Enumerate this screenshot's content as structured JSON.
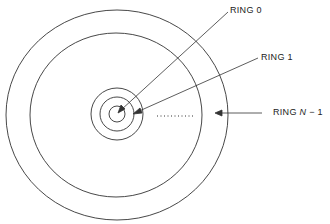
{
  "diagram": {
    "type": "concentric-rings",
    "labels": {
      "ring0": "RING 0",
      "ring1": "RING 1",
      "ringN_prefix": "RING ",
      "ringN_var": "N",
      "ringN_suffix": " − 1"
    },
    "rings_drawn": 5,
    "ellipsis": "........",
    "colors": {
      "stroke": "#333333",
      "background": "#ffffff"
    }
  }
}
